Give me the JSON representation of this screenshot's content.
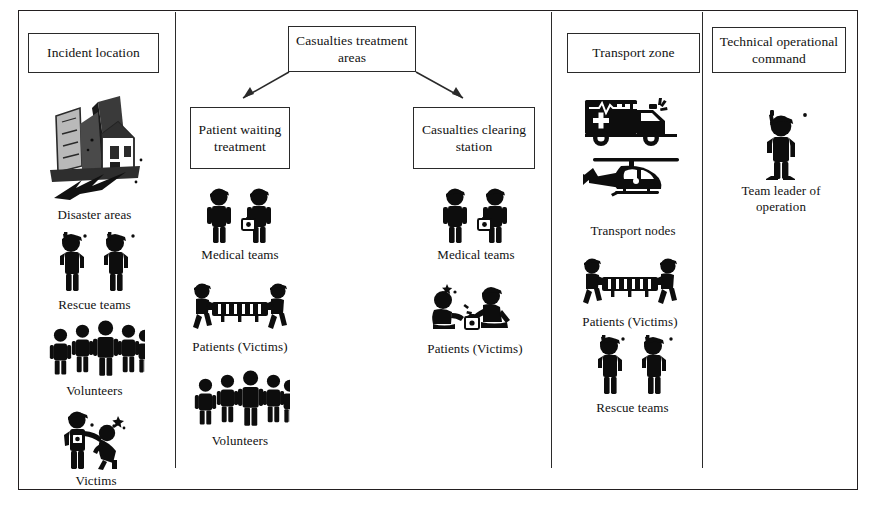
{
  "diagram": {
    "accent_color": "#0d0d0d",
    "frame_color": "#231f20"
  },
  "columns": [
    {
      "id": "incident-location",
      "header": "Incident location",
      "items": [
        {
          "icon": "collapsed-buildings-icon",
          "label": "Disaster areas"
        },
        {
          "icon": "two-radio-responders-icon",
          "label": "Rescue teams"
        },
        {
          "icon": "crowd-of-five-icon",
          "label": "Volunteers"
        },
        {
          "icon": "responder-supporting-injured-icon",
          "label": "Victims"
        }
      ]
    },
    {
      "id": "casualties-treatment-areas",
      "header": "Casualties treatment areas",
      "subzones": [
        {
          "id": "patient-waiting-treatment",
          "header": "Patient waiting treatment",
          "items": [
            {
              "icon": "two-medics-with-kit-icon",
              "label": "Medical teams"
            },
            {
              "icon": "stretcher-carry-icon",
              "label": "Patients (Victims)"
            },
            {
              "icon": "crowd-of-five-icon",
              "label": "Volunteers"
            }
          ]
        },
        {
          "id": "casualties-clearing-station",
          "header": "Casualties clearing station",
          "items": [
            {
              "icon": "two-medics-with-kit-icon",
              "label": "Medical teams"
            },
            {
              "icon": "medic-treating-seated-patient-icon",
              "label": "Patients (Victims)"
            }
          ]
        }
      ]
    },
    {
      "id": "transport-zone",
      "header": "Transport zone",
      "items": [
        {
          "icon": "ambulance-and-helicopter-icon",
          "label": "Transport nodes"
        },
        {
          "icon": "stretcher-carry-icon",
          "label": "Patients (Victims)"
        },
        {
          "icon": "two-radio-responders-icon",
          "label": "Rescue teams"
        }
      ]
    },
    {
      "id": "technical-operational-command",
      "header": "Technical operational command",
      "items": [
        {
          "icon": "single-radio-leader-icon",
          "label": "Team leader of operation"
        }
      ]
    }
  ]
}
